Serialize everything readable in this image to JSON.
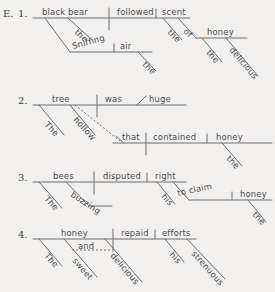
{
  "page": {
    "background_color": "#f1f0ee",
    "ink_color": "#6e6e70",
    "text_color": "#4c4c4e",
    "exercise_label": "E."
  },
  "diagrams": [
    {
      "number": "1.",
      "sentence": "The black bear followed the scent of the delicious honey, sniffing the air.",
      "words": {
        "subject": "black bear",
        "verb": "followed",
        "object": "scent",
        "subject_article": "the",
        "object_article": "the",
        "prep": "of",
        "prep_object": "honey",
        "prep_object_article": "the",
        "prep_object_adj": "delicious",
        "participle": "Sniffing",
        "participle_object": "air",
        "participle_object_article": "the"
      }
    },
    {
      "number": "2.",
      "sentence": "The hollow tree was huge that contained honey.",
      "words": {
        "subject": "tree",
        "verb": "was",
        "predicate_adjective": "huge",
        "subject_article": "The",
        "subject_adj": "hollow",
        "rel_subject": "that",
        "rel_verb": "contained",
        "rel_object": "honey",
        "rel_object_article": "the"
      }
    },
    {
      "number": "3.",
      "sentence": "The buzzing bees disputed his right to claim the honey.",
      "words": {
        "subject": "bees",
        "verb": "disputed",
        "object": "right",
        "subject_article": "The",
        "subject_adj": "buzzing",
        "object_modifier": "his",
        "infinitive": "to claim",
        "infinitive_object": "honey",
        "infinitive_object_article": "the"
      }
    },
    {
      "number": "4.",
      "sentence": "The sweet and delicious honey repaid his strenuous efforts.",
      "words": {
        "subject": "honey",
        "verb": "repaid",
        "object": "efforts",
        "subject_article": "The",
        "subject_adj_1": "sweet",
        "conjunction": "and",
        "subject_adj_2": "delicious",
        "object_modifier": "his",
        "object_adj": "strenuous"
      }
    }
  ]
}
